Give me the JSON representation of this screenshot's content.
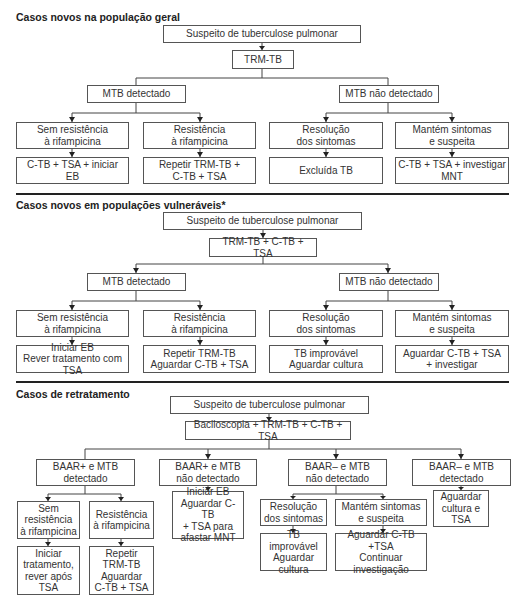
{
  "sections": [
    {
      "title": "Casos novos na população geral",
      "root": "Suspeito de tuberculose pulmonar",
      "test": "TRM-TB",
      "branches": [
        {
          "label": "MTB detectado",
          "children": [
            {
              "label": "Sem resistência\nà rifampicina",
              "action": "C-TB + TSA + iniciar EB"
            },
            {
              "label": "Resistência\nà rifampicina",
              "action": "Repetir TRM-TB +\nC-TB + TSA"
            }
          ]
        },
        {
          "label": "MTB não detectado",
          "children": [
            {
              "label": "Resolução\ndos sintomas",
              "action": "Excluída TB"
            },
            {
              "label": "Mantém sintomas\ne suspeita",
              "action": "C-TB + TSA + investigar\nMNT"
            }
          ]
        }
      ]
    },
    {
      "title": "Casos novos em populações vulneráveis*",
      "root": "Suspeito de tuberculose pulmonar",
      "test": "TRM-TB + C-TB + TSA",
      "branches": [
        {
          "label": "MTB detectado",
          "children": [
            {
              "label": "Sem resistência\nà rifampicina",
              "action": "Iniciar EB\nRever tratamento com TSA"
            },
            {
              "label": "Resistência\nà rifampicina",
              "action": "Repetir TRM-TB\nAguardar C-TB + TSA"
            }
          ]
        },
        {
          "label": "MTB não detectado",
          "children": [
            {
              "label": "Resolução\ndos sintomas",
              "action": "TB improvável\nAguardar cultura"
            },
            {
              "label": "Mantém sintomas\ne suspeita",
              "action": "Aguardar C-TB + TSA\n+ investigar"
            }
          ]
        }
      ]
    },
    {
      "title": "Casos de retratamento",
      "root": "Suspeito de tuberculose pulmonar",
      "test": "Baciloscopia + TRM-TB + C-TB + TSA",
      "branches": [
        {
          "label": "BAAR+ e MTB\ndetectado",
          "children": [
            {
              "label": "Sem\nresistência\nà rifampicina",
              "action": "Iniciar\ntratamento,\nrever após\nTSA"
            },
            {
              "label": "Resistência\nà rifampicina",
              "action": "Repetir\nTRM-TB\nAguardar\nC-TB + TSA"
            }
          ]
        },
        {
          "label": "BAAR+ e MTB\nnão detectado",
          "action": "Iniciar EB\nAguardar C-TB\n+ TSA para\nafastar MNT"
        },
        {
          "label": "BAAR– e MTB\nnão detectado",
          "children": [
            {
              "label": "Resolução\ndos sintomas",
              "action": "TB improvável\nAguardar\ncultura"
            },
            {
              "label": "Mantém sintomas\ne suspeita",
              "action": "Aguardar C-TB +TSA\nContinuar\ninvestigação"
            }
          ]
        },
        {
          "label": "BAAR– e MTB\ndetectado",
          "action": "Aguardar\ncultura e\nTSA"
        }
      ]
    }
  ]
}
